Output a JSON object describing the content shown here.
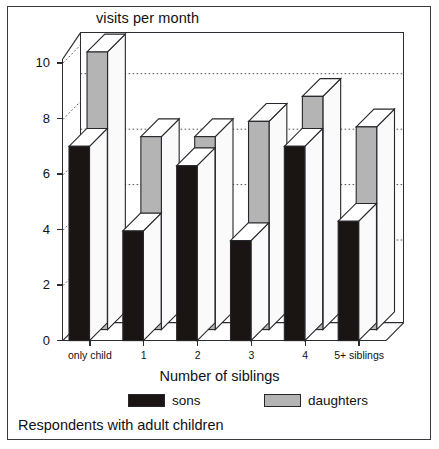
{
  "figure": {
    "title": "visits per month",
    "footer_note": "Respondents with adult children",
    "frame_color": "#3a3a42"
  },
  "legend": {
    "items": [
      {
        "label": "sons",
        "color": "#1a1513",
        "swatch_name": "legend-swatch-sons"
      },
      {
        "label": "daughters",
        "color": "#b4b4b4",
        "swatch_name": "legend-swatch-daughters"
      }
    ]
  },
  "chart_data": {
    "type": "bar",
    "title": "visits per month",
    "subtitle": "Respondents with adult children",
    "xlabel": "Number of siblings",
    "ylabel": "visits per month",
    "categories": [
      "only child",
      "1",
      "2",
      "3",
      "4",
      "5+ siblings"
    ],
    "series": [
      {
        "name": "sons",
        "color": "#1a1513",
        "values": [
          7.0,
          3.95,
          6.3,
          3.6,
          7.0,
          4.3
        ]
      },
      {
        "name": "daughters",
        "color": "#b4b4b4",
        "values": [
          10.0,
          6.95,
          6.95,
          7.5,
          8.4,
          7.3
        ]
      }
    ],
    "ylim": [
      0,
      10
    ],
    "yticks": [
      0,
      2,
      4,
      6,
      8,
      10
    ],
    "ytick_labels": [
      "0",
      "2",
      "4",
      "6",
      "8",
      "10"
    ],
    "grid": "horizontal-dotted",
    "gridlines": [
      7,
      9
    ],
    "legend_position": "bottom",
    "style": "3d-bar"
  }
}
